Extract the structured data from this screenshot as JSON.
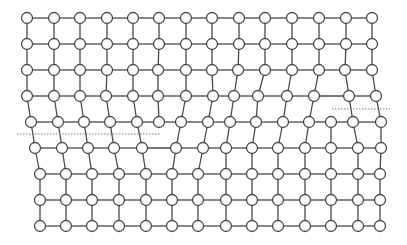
{
  "diagram": {
    "title": "",
    "type": "crystal-lattice-with-dislocations",
    "colors": {
      "line": "#4a4a4a",
      "node_fill": "#ffffff",
      "dash": "#7a7a7a",
      "background": "#ffffff"
    },
    "node_radius": 5.5,
    "rows": [
      {
        "y": 18,
        "x": [
          27,
          54,
          80,
          107,
          133,
          159,
          186,
          212,
          239,
          265,
          292,
          319,
          346,
          372
        ]
      },
      {
        "y": 44,
        "x": [
          27,
          54,
          80,
          107,
          133,
          159,
          186,
          212,
          239,
          265,
          292,
          319,
          346,
          372
        ]
      },
      {
        "y": 70,
        "x": [
          27,
          54,
          80,
          107,
          133,
          158,
          186,
          212,
          238,
          265,
          292,
          319,
          345,
          372
        ]
      },
      {
        "y": 96,
        "x": [
          27,
          54,
          80,
          106,
          133,
          158,
          186,
          213,
          234,
          258,
          287,
          314,
          349,
          376
        ]
      },
      {
        "y": 122,
        "x": [
          31,
          58,
          84,
          110,
          137,
          159,
          181,
          208,
          230,
          256,
          283,
          309,
          331,
          353,
          381
        ]
      },
      {
        "y": 148,
        "x": [
          35,
          62,
          88,
          114,
          142,
          176,
          203,
          226,
          252,
          278,
          305,
          331,
          358,
          381
        ]
      },
      {
        "y": 174,
        "x": [
          40,
          66,
          92,
          119,
          146,
          172,
          198,
          226,
          252,
          278,
          305,
          331,
          358,
          380
        ]
      },
      {
        "y": 200,
        "x": [
          40,
          66,
          92,
          119,
          146,
          172,
          198,
          226,
          252,
          278,
          305,
          331,
          358,
          380
        ]
      },
      {
        "y": 226,
        "x": [
          40,
          66,
          92,
          119,
          146,
          172,
          198,
          226,
          252,
          278,
          305,
          331,
          358,
          380
        ]
      }
    ],
    "vertical_links": [
      {
        "from_row": 0,
        "pairs": [
          [
            0,
            0
          ],
          [
            1,
            1
          ],
          [
            2,
            2
          ],
          [
            3,
            3
          ],
          [
            4,
            4
          ],
          [
            5,
            5
          ],
          [
            6,
            6
          ],
          [
            7,
            7
          ],
          [
            8,
            8
          ],
          [
            9,
            9
          ],
          [
            10,
            10
          ],
          [
            11,
            11
          ],
          [
            12,
            12
          ],
          [
            13,
            13
          ]
        ]
      },
      {
        "from_row": 1,
        "pairs": [
          [
            0,
            0
          ],
          [
            1,
            1
          ],
          [
            2,
            2
          ],
          [
            3,
            3
          ],
          [
            4,
            4
          ],
          [
            5,
            5
          ],
          [
            6,
            6
          ],
          [
            7,
            7
          ],
          [
            8,
            8
          ],
          [
            9,
            9
          ],
          [
            10,
            10
          ],
          [
            11,
            11
          ],
          [
            12,
            12
          ],
          [
            13,
            13
          ]
        ]
      },
      {
        "from_row": 2,
        "pairs": [
          [
            0,
            0
          ],
          [
            1,
            1
          ],
          [
            2,
            2
          ],
          [
            3,
            3
          ],
          [
            4,
            4
          ],
          [
            5,
            5
          ],
          [
            6,
            6
          ],
          [
            7,
            7
          ],
          [
            8,
            8
          ],
          [
            9,
            9
          ],
          [
            10,
            10
          ],
          [
            11,
            11
          ],
          [
            12,
            12
          ],
          [
            13,
            13
          ]
        ]
      },
      {
        "from_row": 3,
        "pairs": [
          [
            0,
            0
          ],
          [
            1,
            1
          ],
          [
            2,
            2
          ],
          [
            3,
            3
          ],
          [
            4,
            4
          ],
          [
            5,
            5
          ],
          [
            6,
            6
          ],
          [
            7,
            7
          ],
          [
            8,
            8
          ],
          [
            9,
            9
          ],
          [
            10,
            10
          ],
          [
            11,
            11
          ],
          [
            12,
            13
          ],
          [
            13,
            14
          ]
        ]
      },
      {
        "from_row": 4,
        "pairs": [
          [
            0,
            0
          ],
          [
            1,
            1
          ],
          [
            2,
            2
          ],
          [
            3,
            3
          ],
          [
            4,
            4
          ],
          [
            6,
            5
          ],
          [
            7,
            6
          ],
          [
            8,
            7
          ],
          [
            9,
            8
          ],
          [
            10,
            9
          ],
          [
            11,
            10
          ],
          [
            12,
            11
          ],
          [
            13,
            12
          ],
          [
            14,
            13
          ]
        ]
      },
      {
        "from_row": 5,
        "pairs": [
          [
            0,
            0
          ],
          [
            1,
            1
          ],
          [
            2,
            2
          ],
          [
            3,
            3
          ],
          [
            4,
            4
          ],
          [
            5,
            5
          ],
          [
            6,
            6
          ],
          [
            7,
            7
          ],
          [
            8,
            8
          ],
          [
            9,
            9
          ],
          [
            10,
            10
          ],
          [
            11,
            11
          ],
          [
            12,
            12
          ],
          [
            13,
            13
          ]
        ]
      },
      {
        "from_row": 6,
        "pairs": [
          [
            0,
            0
          ],
          [
            1,
            1
          ],
          [
            2,
            2
          ],
          [
            3,
            3
          ],
          [
            4,
            4
          ],
          [
            5,
            5
          ],
          [
            6,
            6
          ],
          [
            7,
            7
          ],
          [
            8,
            8
          ],
          [
            9,
            9
          ],
          [
            10,
            10
          ],
          [
            11,
            11
          ],
          [
            12,
            12
          ],
          [
            13,
            13
          ]
        ]
      },
      {
        "from_row": 7,
        "pairs": [
          [
            0,
            0
          ],
          [
            1,
            1
          ],
          [
            2,
            2
          ],
          [
            3,
            3
          ],
          [
            4,
            4
          ],
          [
            5,
            5
          ],
          [
            6,
            6
          ],
          [
            7,
            7
          ],
          [
            8,
            8
          ],
          [
            9,
            9
          ],
          [
            10,
            10
          ],
          [
            11,
            11
          ],
          [
            12,
            12
          ],
          [
            13,
            13
          ]
        ]
      }
    ],
    "slip_planes": [
      {
        "name": "left-slip-plane",
        "x1": 17,
        "x2": 160,
        "y": 134
      },
      {
        "name": "right-slip-plane",
        "x1": 332,
        "x2": 390,
        "y": 109
      }
    ]
  }
}
